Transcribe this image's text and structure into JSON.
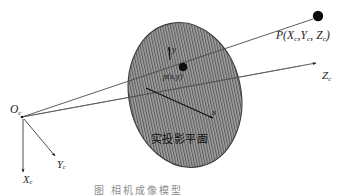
{
  "figure": {
    "caption": "图    相机成像模型",
    "background_color": "#ffffff",
    "ink_color": "#1a1a1a",
    "plane_fill_color": "#9a9a9a",
    "plane_hatch_color": "#5e5e5e"
  },
  "labels": {
    "point_P": "P(X",
    "point_P_sub1": "c",
    "point_P_mid": ",Y",
    "point_P_sub2": "c",
    "point_P_mid2": ", Z",
    "point_P_sub3": "c",
    "point_P_end": ")",
    "axis_Zc": "Z",
    "axis_Zc_sub": "c",
    "origin_Oc": "O",
    "origin_Oc_sub": "c",
    "axis_Yc": "Y",
    "axis_Yc_sub": "c",
    "axis_Xc": "X",
    "axis_Xc_sub": "c",
    "image_axis_y": "y",
    "image_axis_x": "x",
    "image_point_p": "p(x,y)",
    "plane_name": "实投影平面"
  },
  "geometry": {
    "origin": {
      "x": 22,
      "y": 117
    },
    "point_P": {
      "x": 318,
      "y": 16
    },
    "image_point_p": {
      "x": 183,
      "y": 67
    },
    "axis_Zc_end": {
      "x": 320,
      "y": 62
    },
    "axis_Yc_end": {
      "x": 56,
      "y": 158
    },
    "axis_Xc_end": {
      "x": 24,
      "y": 174
    },
    "ellipse_center": {
      "x": 185,
      "y": 95
    },
    "ellipse_rx": 56,
    "ellipse_ry": 73,
    "ellipse_rotation_deg": -12,
    "hatch_spacing_px": 2.6
  }
}
